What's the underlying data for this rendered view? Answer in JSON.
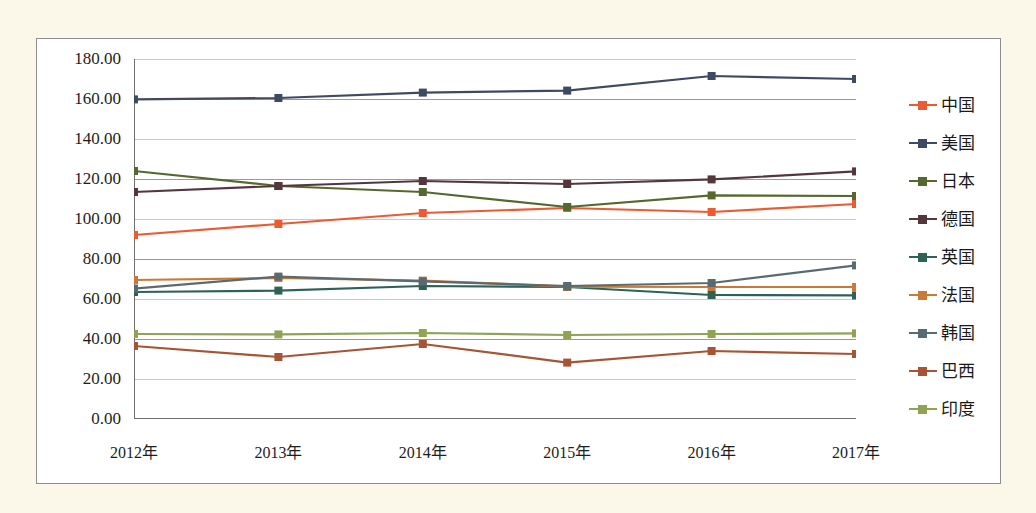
{
  "chart_data": {
    "type": "line",
    "title": "",
    "xlabel": "",
    "ylabel": "",
    "categories": [
      "2012年",
      "2013年",
      "2014年",
      "2015年",
      "2016年",
      "2017年"
    ],
    "ylim": [
      0,
      180
    ],
    "ytick_step": 20,
    "ytick_labels": [
      "180.00",
      "160.00",
      "140.00",
      "120.00",
      "100.00",
      "80.00",
      "60.00",
      "40.00",
      "20.00",
      "0.00"
    ],
    "ytick_values": [
      180,
      160,
      140,
      120,
      100,
      80,
      60,
      40,
      20,
      0
    ],
    "grid": true,
    "legend_position": "right",
    "marker": "square",
    "series": [
      {
        "name": "中国",
        "color": "#ea5b32",
        "values": [
          92.0,
          97.5,
          103.0,
          105.5,
          103.5,
          107.5
        ]
      },
      {
        "name": "美国",
        "color": "#3e4a63",
        "values": [
          159.8,
          160.5,
          163.2,
          164.2,
          171.5,
          170.0
        ]
      },
      {
        "name": "日本",
        "color": "#56682f",
        "values": [
          124.0,
          116.5,
          113.5,
          106.0,
          111.8,
          111.5
        ]
      },
      {
        "name": "德国",
        "color": "#54363d",
        "values": [
          113.5,
          116.5,
          119.0,
          117.5,
          119.8,
          123.8
        ]
      },
      {
        "name": "英国",
        "color": "#2f6257",
        "values": [
          63.5,
          64.2,
          66.5,
          66.0,
          62.0,
          61.8
        ]
      },
      {
        "name": "法国",
        "color": "#cc7a33",
        "values": [
          69.5,
          70.5,
          69.2,
          66.2,
          66.0,
          66.0
        ]
      },
      {
        "name": "韩国",
        "color": "#5a6a72",
        "values": [
          65.2,
          71.2,
          68.8,
          66.5,
          68.0,
          76.8
        ]
      },
      {
        "name": "巴西",
        "color": "#a65434",
        "values": [
          36.5,
          31.0,
          37.5,
          28.2,
          34.0,
          32.5
        ]
      },
      {
        "name": "印度",
        "color": "#8fa353",
        "values": [
          42.5,
          42.3,
          43.0,
          42.0,
          42.5,
          42.8
        ]
      }
    ]
  },
  "colors": {
    "page_background": "#fbf8e9",
    "panel_background": "#ffffff",
    "panel_border": "#8d8d8d",
    "gridline": "#9a9a96",
    "axis": "#6f6f6c",
    "text": "#1d1d1d"
  }
}
